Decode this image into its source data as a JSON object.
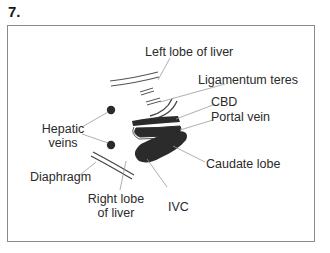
{
  "figure": {
    "number": "7."
  },
  "labels": {
    "left_lobe": "Left lobe of liver",
    "ligamentum_teres": "Ligamentum teres",
    "cbd": "CBD",
    "portal_vein": "Portal vein",
    "hepatic_veins_line1": "Hepatic",
    "hepatic_veins_line2": "veins",
    "caudate_lobe": "Caudate lobe",
    "diaphragm": "Diaphragm",
    "right_lobe_line1": "Right lobe",
    "right_lobe_line2": "of liver",
    "ivc": "IVC"
  },
  "colors": {
    "line": "#7a7a7a",
    "structure_fill": "#2b2b2b",
    "frame": "#8a8a8a"
  }
}
